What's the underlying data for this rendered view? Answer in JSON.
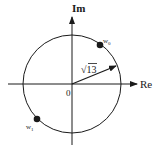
{
  "diagram": {
    "type": "complex-plane",
    "axes": {
      "real_label": "Re",
      "imag_label": "Im",
      "origin_label": "0"
    },
    "circle": {
      "radius_label": "√13"
    },
    "points": [
      {
        "label": "w",
        "subscript": "0"
      },
      {
        "label": "w",
        "subscript": "1"
      }
    ],
    "colors": {
      "stroke": "#1a1a1a",
      "background": "#ffffff"
    }
  }
}
